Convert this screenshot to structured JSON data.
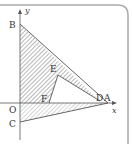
{
  "figure": {
    "type": "coordinate-geometry-diagram",
    "axes": {
      "x_label": "x",
      "y_label": "y",
      "origin_label": "O"
    },
    "points": [
      {
        "id": "B",
        "label": "B",
        "x": 20,
        "y": 24
      },
      {
        "id": "E",
        "label": "E",
        "x": 58,
        "y": 75
      },
      {
        "id": "F",
        "label": "F",
        "x": 49,
        "y": 103
      },
      {
        "id": "D",
        "label": "D",
        "x": 100,
        "y": 101
      },
      {
        "id": "A",
        "label": "A",
        "x": 108,
        "y": 103
      },
      {
        "id": "C",
        "label": "C",
        "x": 20,
        "y": 122
      },
      {
        "id": "O",
        "label": "O",
        "x": 20,
        "y": 103
      }
    ],
    "shaded_regions": [
      "quadrilateral B-O-F-E with band E-D",
      "triangle O-A-C"
    ],
    "colors": {
      "line": "#444444",
      "hatch": "#888888",
      "frame": "#aaaaaa",
      "background": "#ffffff"
    }
  }
}
